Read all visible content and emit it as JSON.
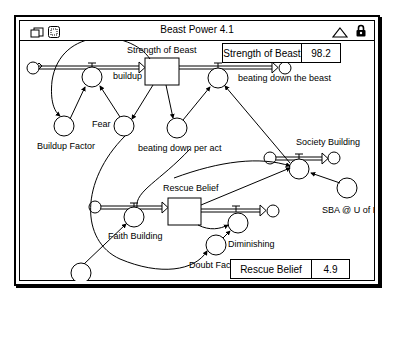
{
  "window": {
    "title": "Beast Power 4.1",
    "icons": [
      "stack-icon",
      "grid-icon",
      "up-triangle-icon",
      "lock-icon"
    ]
  },
  "diagram": {
    "stocks": [
      {
        "name": "Strength of Beast"
      },
      {
        "name": "Rescue Belief"
      }
    ],
    "flows": [
      {
        "name": "buildup"
      },
      {
        "name": "beating down the beast"
      },
      {
        "name": "Faith Building"
      },
      {
        "name": "Diminishing"
      },
      {
        "name": "Society Building"
      }
    ],
    "converters": [
      {
        "name": "Buildup Factor"
      },
      {
        "name": "Fear"
      },
      {
        "name": "beating down per act"
      },
      {
        "name": "SBA @ U of RB"
      },
      {
        "name": "Memory of home"
      },
      {
        "name": "Doubt Factor"
      }
    ]
  },
  "numeric_displays": [
    {
      "label": "Strength of Beast",
      "value": "98.2"
    },
    {
      "label": "Rescue Belief",
      "value": "4.9"
    }
  ]
}
